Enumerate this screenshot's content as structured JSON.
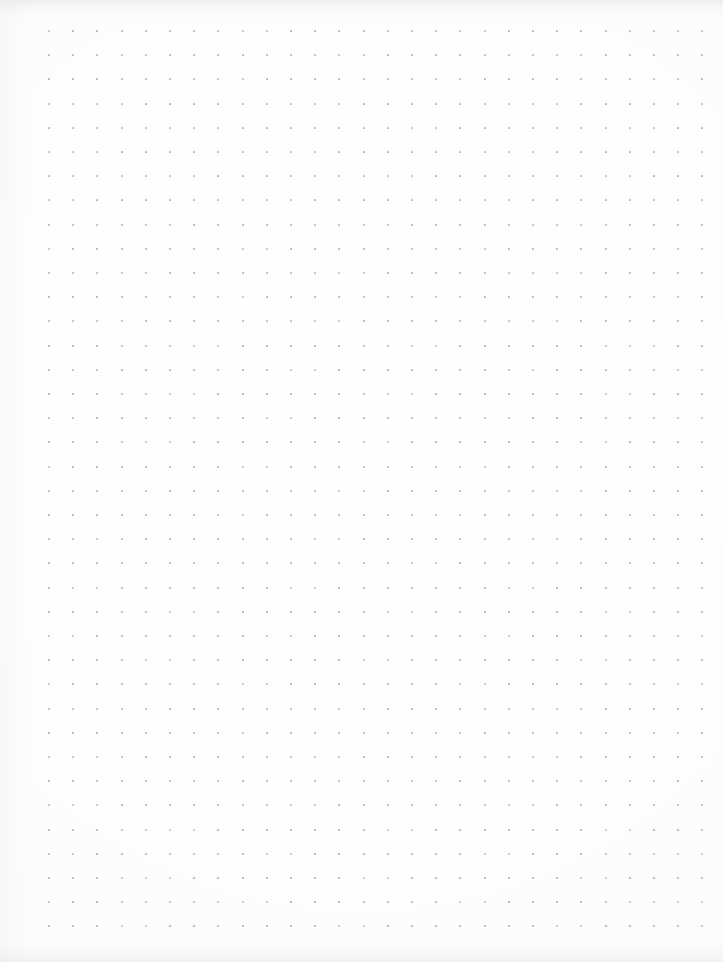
{
  "page": {
    "kind": "dot-grid-paper",
    "width": 723,
    "height": 962,
    "background_color": "#fdfdfd",
    "has_text": false,
    "has_handwriting": false
  },
  "grid": {
    "dot_color": "#b5b5bd",
    "dot_size_px": 2,
    "spacing_px": 24.2,
    "origin_x_px": 48,
    "origin_y_px": 30,
    "columns": 28,
    "rows": 38,
    "last_dot_x_px": 699,
    "last_dot_y_px": 934
  },
  "margins": {
    "left_px": 48,
    "right_px": 24,
    "top_px": 30,
    "bottom_px": 28
  },
  "scan_artifacts": {
    "top_edge_shading": "#bcbec4",
    "bottom_edge_shading": "#c4c6cc",
    "left_edge_shading": "#cccdd3"
  },
  "content": {
    "items": []
  }
}
